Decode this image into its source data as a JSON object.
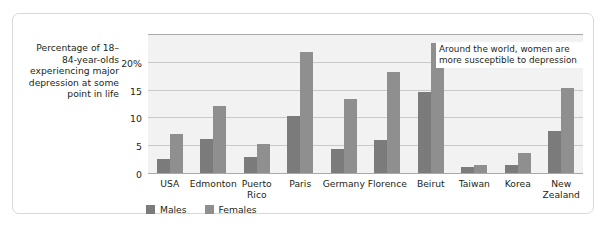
{
  "chart_data": {
    "type": "bar",
    "title": "",
    "xlabel": "",
    "ylabel": "Percentage of 18–84-year-olds experiencing major depression at some point in life",
    "ylim": [
      0,
      25
    ],
    "yticks": [
      0,
      5,
      10,
      15,
      20
    ],
    "ytick_labels": [
      "0",
      "5",
      "10",
      "15",
      "20%"
    ],
    "grid": true,
    "legend_position": "bottom-left",
    "categories": [
      "USA",
      "Edmonton",
      "Puerto\nRico",
      "Paris",
      "Germany",
      "Florence",
      "Beirut",
      "Taiwan",
      "Korea",
      "New\nZealand"
    ],
    "series": [
      {
        "name": "Males",
        "color": "#7b7b7b",
        "values": [
          2.7,
          6.3,
          3.1,
          10.5,
          4.5,
          6.2,
          14.8,
          1.2,
          1.7,
          7.8
        ]
      },
      {
        "name": "Females",
        "color": "#8f8f8f",
        "values": [
          7.2,
          12.3,
          5.4,
          22.0,
          13.5,
          18.3,
          23.5,
          1.7,
          3.8,
          15.5
        ]
      }
    ],
    "annotations": [
      {
        "text": "Around the world, women are more susceptible to depression"
      }
    ]
  },
  "axis_caption": "Percentage of\n18–84-year-olds\nexperiencing\nmajor\ndepression\nat some\npoint in life",
  "colors": {
    "male_bar": "#7b7b7b",
    "female_bar": "#8f8f8f",
    "plot_background": "#f2f2f2",
    "gridline": "#c9c9c9",
    "axis": "#a9a9a9",
    "frame_border": "#d8d8d8",
    "text": "#231f20"
  }
}
